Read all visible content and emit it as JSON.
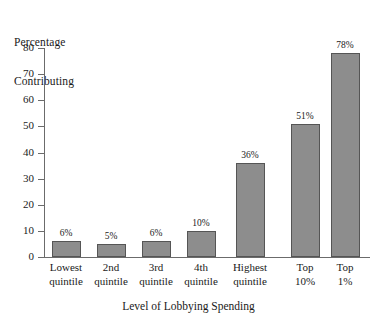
{
  "chart_data": {
    "type": "bar",
    "title": "",
    "xlabel": "Level of Lobbying Spending",
    "ylabel": "Percentage Contributing",
    "ylabel_lines": [
      "Percentage",
      "Contributing"
    ],
    "categories": [
      "Lowest quintile",
      "2nd quintile",
      "3rd quintile",
      "4th quintile",
      "Highest quintile",
      "Top 10%",
      "Top 1%"
    ],
    "category_lines": [
      [
        "Lowest",
        "quintile"
      ],
      [
        "2nd",
        "quintile"
      ],
      [
        "3rd",
        "quintile"
      ],
      [
        "4th",
        "quintile"
      ],
      [
        "Highest",
        "quintile"
      ],
      [
        "Top",
        "10%"
      ],
      [
        "Top",
        "1%"
      ]
    ],
    "values": [
      6,
      5,
      6,
      10,
      36,
      51,
      78
    ],
    "value_labels": [
      "6%",
      "5%",
      "6%",
      "10%",
      "36%",
      "51%",
      "78%"
    ],
    "ylim": [
      0,
      80
    ],
    "yticks": [
      0,
      10,
      20,
      30,
      40,
      50,
      60,
      70,
      80
    ],
    "ytick_labels": [
      "0",
      "10",
      "20",
      "30",
      "40",
      "50",
      "60",
      "70",
      "80"
    ],
    "grid": false,
    "legend": null,
    "colors": {
      "bar_fill": "#8d8d8d",
      "bar_border": "#555555",
      "axis": "#6b6b6b",
      "text": "#1a1a1a",
      "background": "#ffffff"
    }
  }
}
